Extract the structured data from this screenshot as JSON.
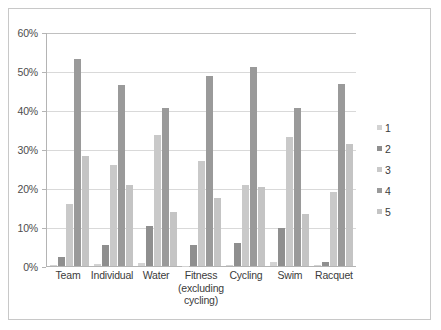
{
  "chart_data": {
    "type": "bar",
    "title": "",
    "subtitle": "",
    "xlabel": "",
    "ylabel": "",
    "ylim": [
      0,
      60
    ],
    "y_tick_labels": [
      "0%",
      "10%",
      "20%",
      "30%",
      "40%",
      "50%",
      "60%"
    ],
    "y_tick_values": [
      0,
      10,
      20,
      30,
      40,
      50,
      60
    ],
    "grid": true,
    "legend_position": "right",
    "value_suffix": "%",
    "categories": [
      "Team",
      "Individual",
      "Water",
      "Fitness (excluding cycling)",
      "Cycling",
      "Swim",
      "Racquet"
    ],
    "category_lines": [
      [
        "Team"
      ],
      [
        "Individual"
      ],
      [
        "Water"
      ],
      [
        "Fitness",
        "(excluding",
        "cycling)"
      ],
      [
        "Cycling"
      ],
      [
        "Swim"
      ],
      [
        "Racquet"
      ]
    ],
    "series": [
      {
        "name": "1",
        "color": "#d3d3d3",
        "values": [
          0.2,
          0.5,
          0.8,
          0.1,
          0.2,
          1.0,
          0.2
        ]
      },
      {
        "name": "2",
        "color": "#8f8f8f",
        "values": [
          2.4,
          5.5,
          10.2,
          5.5,
          5.8,
          9.7,
          1.1
        ]
      },
      {
        "name": "3",
        "color": "#c9c9c9",
        "values": [
          15.8,
          25.9,
          33.5,
          27.0,
          20.9,
          33.1,
          19.0
        ]
      },
      {
        "name": "4",
        "color": "#9a9a9a",
        "values": [
          53.2,
          46.4,
          40.5,
          48.7,
          51.1,
          40.6,
          46.6
        ]
      },
      {
        "name": "5",
        "color": "#c4c4c4",
        "values": [
          28.3,
          20.8,
          13.9,
          17.5,
          20.3,
          13.3,
          31.2
        ]
      }
    ]
  },
  "legend": {
    "items": [
      {
        "label": "1",
        "color": "#d3d3d3"
      },
      {
        "label": "2",
        "color": "#8f8f8f"
      },
      {
        "label": "3",
        "color": "#c9c9c9"
      },
      {
        "label": "4",
        "color": "#9a9a9a"
      },
      {
        "label": "5",
        "color": "#c4c4c4"
      }
    ]
  },
  "frame": {
    "border_color": "#c8c8c8",
    "background": "#ffffff"
  }
}
